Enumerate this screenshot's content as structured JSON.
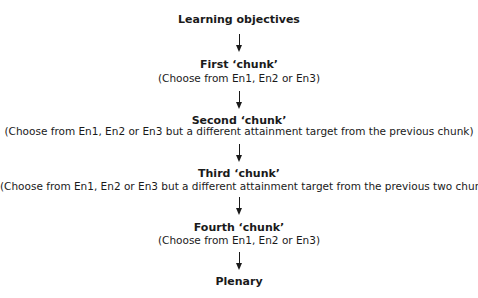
{
  "flowchart": {
    "steps": [
      {
        "title": "Learning objectives",
        "subtitle": null
      },
      {
        "title": "First ‘chunk’",
        "subtitle": "(Choose from En1, En2 or En3)"
      },
      {
        "title": "Second ‘chunk’",
        "subtitle": "(Choose from En1, En2 or En3 but a different attainment target from the previous chunk)"
      },
      {
        "title": "Third ‘chunk’",
        "subtitle": "(Choose from En1, En2 or En3 but a different attainment target from the previous two chunks)"
      },
      {
        "title": "Fourth ‘chunk’",
        "subtitle": "(Choose from En1, En2 or En3)"
      },
      {
        "title": "Plenary",
        "subtitle": null
      }
    ],
    "arrow_color": "#1a1a1a",
    "text_color": "#1a1a1a"
  }
}
